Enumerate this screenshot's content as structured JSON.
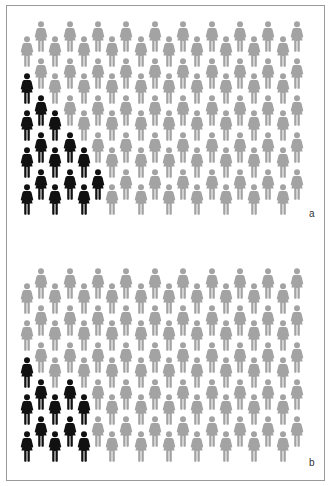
{
  "chart_data": [
    {
      "type": "pictogram",
      "panel_label": "a",
      "icon": "female-person-icon",
      "total": 100,
      "highlighted": 15,
      "columns": 20,
      "rows_per_column": 5,
      "layout": "staggered columns (alternating low/high), highlighted figures clustered bottom-left",
      "highlighted_per_column_from_bottom": [
        4,
        3,
        3,
        2,
        2,
        1,
        0,
        0,
        0,
        0,
        0,
        0,
        0,
        0,
        0,
        0,
        0,
        0,
        0,
        0
      ],
      "colors": {
        "highlighted": "#111111",
        "base": "#a3a3a3"
      }
    },
    {
      "type": "pictogram",
      "panel_label": "b",
      "icon": "female-person-icon",
      "total": 100,
      "highlighted": 11,
      "columns": 20,
      "rows_per_column": 5,
      "layout": "staggered columns (alternating low/high), highlighted figures clustered bottom-left",
      "highlighted_per_column_from_bottom": [
        3,
        2,
        2,
        2,
        2,
        0,
        0,
        0,
        0,
        0,
        0,
        0,
        0,
        0,
        0,
        0,
        0,
        0,
        0,
        0
      ],
      "colors": {
        "highlighted": "#111111",
        "base": "#a3a3a3"
      }
    }
  ],
  "panels": {
    "a": {
      "label": "a"
    },
    "b": {
      "label": "b"
    }
  }
}
